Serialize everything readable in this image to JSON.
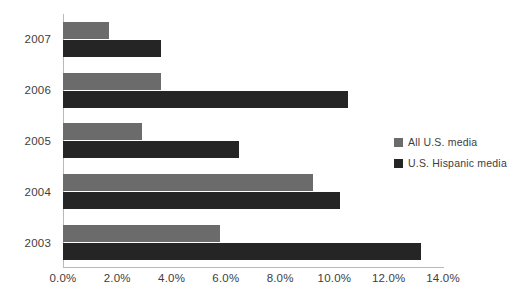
{
  "chart_data": {
    "type": "bar",
    "orientation": "horizontal",
    "title": "",
    "xlabel": "",
    "ylabel": "",
    "categories": [
      "2007",
      "2006",
      "2005",
      "2004",
      "2003"
    ],
    "series": [
      {
        "name": "All U.S. media",
        "color": "#6b6b6b",
        "values": [
          1.7,
          3.6,
          2.9,
          9.2,
          5.8
        ]
      },
      {
        "name": "U.S. Hispanic media",
        "color": "#252525",
        "values": [
          3.6,
          10.5,
          6.5,
          10.2,
          13.2
        ]
      }
    ],
    "xlim": [
      0.0,
      14.0
    ],
    "xticks": [
      0.0,
      2.0,
      4.0,
      6.0,
      8.0,
      10.0,
      12.0,
      14.0
    ],
    "xtick_labels": [
      "0.0%",
      "2.0%",
      "4.0%",
      "6.0%",
      "8.0%",
      "10.0%",
      "12.0%",
      "14.0%"
    ],
    "value_format": "percent",
    "grid": false,
    "legend_position": "right-middle",
    "axis_color": "#b9b9b9",
    "background": "#ffffff"
  },
  "legend": {
    "items": [
      {
        "label": "All U.S. media",
        "color": "#6b6b6b"
      },
      {
        "label": "U.S. Hispanic media",
        "color": "#252525"
      }
    ]
  }
}
